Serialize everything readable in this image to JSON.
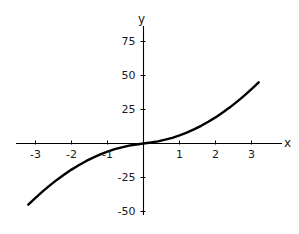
{
  "chart_data": {
    "type": "line",
    "title": "",
    "subtitle": "",
    "xlabel": "x",
    "ylabel": "y",
    "xlim": [
      -3.25,
      3.25
    ],
    "ylim": [
      -60,
      88
    ],
    "grid": false,
    "legend": null,
    "xticks": [
      -3,
      -2,
      -1,
      1,
      2,
      3
    ],
    "xtick_labels": [
      "-3",
      "-2",
      "-1",
      "1",
      "2",
      "3"
    ],
    "yticks": [
      -50,
      -25,
      25,
      50,
      75
    ],
    "ytick_labels": [
      "-50",
      "-25",
      "25",
      "50",
      "75"
    ],
    "axis_color": "#000000",
    "curve_color": "#000000",
    "background": "#ffffff",
    "series": [
      {
        "name": "curve",
        "x": [
          -3.2,
          -3.0,
          -2.8,
          -2.6,
          -2.4,
          -2.2,
          -2.0,
          -1.8,
          -1.6,
          -1.4,
          -1.2,
          -1.0,
          -0.8,
          -0.6,
          -0.4,
          -0.2,
          0.0,
          0.2,
          0.4,
          0.6,
          0.8,
          1.0,
          1.2,
          1.4,
          1.6,
          1.8,
          2.0,
          2.2,
          2.4,
          2.6,
          2.8,
          3.0,
          3.2
        ],
        "y": [
          -45.0,
          -40.0,
          -35.2,
          -30.8,
          -26.6,
          -22.8,
          -19.2,
          -16.0,
          -13.0,
          -10.4,
          -8.0,
          -6.0,
          -4.2,
          -2.8,
          -1.6,
          -0.7,
          0.0,
          0.7,
          1.6,
          2.8,
          4.2,
          6.0,
          8.0,
          10.4,
          13.0,
          16.0,
          19.2,
          22.8,
          26.6,
          30.8,
          35.2,
          40.0,
          45.0
        ]
      }
    ]
  },
  "axis_labels": {
    "y_axis_name": "y",
    "x_axis_name": "x"
  }
}
